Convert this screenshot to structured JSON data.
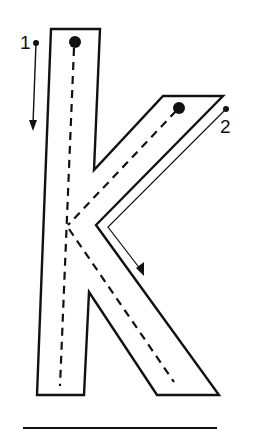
{
  "worksheet": {
    "letter": "k",
    "strokes": [
      {
        "number": "1",
        "direction": "down",
        "description": "vertical stem stroke"
      },
      {
        "number": "2",
        "direction": "diagonal-in-then-out",
        "description": "arm and leg stroke"
      }
    ],
    "labels": {
      "stroke_1": "1",
      "stroke_2": "2"
    },
    "colors": {
      "ink": "#111111",
      "paper": "#ffffff"
    }
  }
}
